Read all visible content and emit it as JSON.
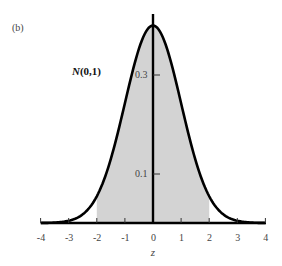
{
  "chart_data": {
    "type": "area",
    "title": "",
    "panel_label": "(b)",
    "annotation": "N(0,1)",
    "xlabel": "z",
    "ylabel": "",
    "xlim": [
      -4,
      4
    ],
    "ylim": [
      0,
      0.42
    ],
    "x_ticks": [
      -4,
      -3,
      -2,
      -1,
      0,
      1,
      2,
      3,
      4
    ],
    "x_tick_labels": [
      "-4",
      "-3",
      "-2",
      "-1",
      "0",
      "1",
      "2",
      "3",
      "4"
    ],
    "y_ticks": [
      0.1,
      0.3
    ],
    "y_tick_labels": [
      "0.1",
      "0.3"
    ],
    "grid": false,
    "series": [
      {
        "name": "N(0,1) density",
        "x": [
          -4,
          -3.5,
          -3,
          -2.5,
          -2,
          -1.5,
          -1,
          -0.5,
          0,
          0.5,
          1,
          1.5,
          2,
          2.5,
          3,
          3.5,
          4
        ],
        "values": [
          0.0001,
          0.0009,
          0.0044,
          0.0175,
          0.054,
          0.1295,
          0.242,
          0.3521,
          0.3989,
          0.3521,
          0.242,
          0.1295,
          0.054,
          0.0175,
          0.0044,
          0.0009,
          0.0001
        ]
      }
    ],
    "shaded_region": {
      "from": -2,
      "to": 2,
      "color": "#d3d3d3"
    },
    "colors": {
      "curve": "#000000",
      "shade": "#d3d3d3",
      "axis": "#000000"
    }
  },
  "labels": {
    "panel": "(b)",
    "dist_prefix": "N",
    "dist_params": "(0,1)",
    "xlabel": "z",
    "y03": "0.3",
    "y01": "0.1",
    "x": [
      "-4",
      "-3",
      "-2",
      "-1",
      "0",
      "1",
      "2",
      "3",
      "4"
    ]
  }
}
